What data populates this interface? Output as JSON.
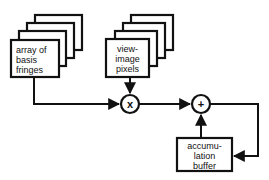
{
  "diagram": {
    "nodes": {
      "basis_fringes": {
        "label_lines": [
          "array of",
          "basis",
          "fringes"
        ]
      },
      "view_image": {
        "label_lines": [
          "view-",
          "image",
          "pixels"
        ]
      },
      "multiply": {
        "symbol": "x"
      },
      "add": {
        "symbol": "+"
      },
      "accumulation_buffer": {
        "label_lines": [
          "accumu-",
          "lation",
          "buffer"
        ]
      }
    },
    "edges": [
      {
        "from": "basis_fringes",
        "to": "multiply"
      },
      {
        "from": "view_image",
        "to": "multiply"
      },
      {
        "from": "multiply",
        "to": "add"
      },
      {
        "from": "accumulation_buffer",
        "to": "add"
      },
      {
        "from": "add",
        "to": "accumulation_buffer"
      }
    ],
    "colors": {
      "stroke": "#111111",
      "background": "#ffffff"
    }
  }
}
